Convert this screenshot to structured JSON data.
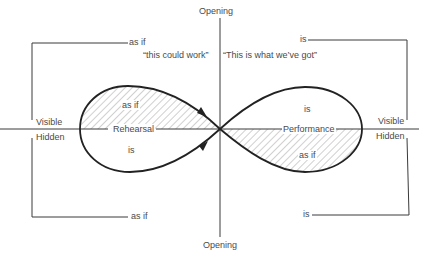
{
  "axes": {
    "vertical_top_label": "Opening",
    "vertical_bottom_label": "Opening",
    "left_visible_label": "Visible",
    "left_hidden_label": "Hidden",
    "right_visible_label": "Visible",
    "right_hidden_label": "Hidden"
  },
  "brackets": {
    "left_top_label": "as if",
    "left_bottom_label": "as if",
    "right_top_label": "is",
    "right_bottom_label": "is"
  },
  "quotes": {
    "left": "“this could work”",
    "right": "“This is what we’ve got”"
  },
  "left_lobe": {
    "name": "Rehearsal",
    "upper_label": "as if",
    "lower_label": "is",
    "shaded_half": "upper"
  },
  "right_lobe": {
    "name": "Performance",
    "upper_label": "is",
    "lower_label": "as if",
    "shaded_half": "lower"
  },
  "colors": {
    "line": "#2a2a2a",
    "hatch": "#8a8a8a",
    "text": "#4a4a4a"
  }
}
